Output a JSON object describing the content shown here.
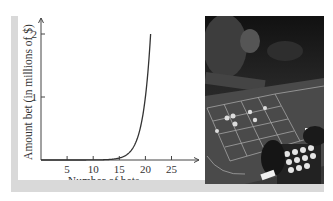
{
  "chart_data": {
    "type": "line",
    "title": "",
    "xlabel": "Number of bets",
    "ylabel": "Amount bet (in millions of $)",
    "x_ticks": [
      "5",
      "10",
      "15",
      "20",
      "25"
    ],
    "y_ticks": [
      "1",
      "2"
    ],
    "xlim": [
      0,
      29
    ],
    "ylim": [
      0,
      2.3
    ],
    "grid": false,
    "legend": null,
    "series": [
      {
        "name": "Amount bet",
        "x": [
          0,
          5,
          10,
          14,
          15,
          16,
          17,
          18,
          19,
          20,
          21
        ],
        "values": [
          1e-06,
          3.2e-05,
          0.001,
          0.016,
          0.033,
          0.066,
          0.131,
          0.262,
          0.524,
          1.049,
          2.0
        ]
      }
    ]
  },
  "photo": {
    "description": "Black-and-white photograph of a roulette table with players' hands and chips"
  }
}
